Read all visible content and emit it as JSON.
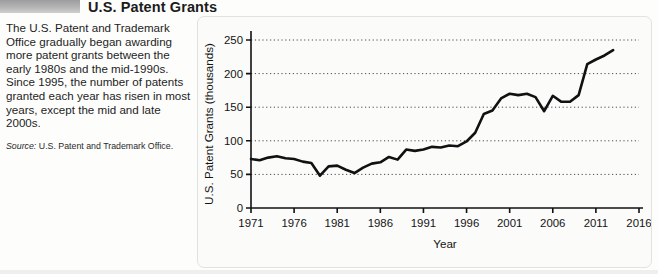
{
  "figure": {
    "title": "U.S. Patent Grants",
    "blurb": "The U.S. Patent and Trademark Office gradually began awarding more patent grants between the early 1980s and the mid-1990s. Since 1995, the number of patents granted each year has risen in most years, except the mid and late 2000s.",
    "source_lead": "Source:",
    "source_text": " U.S. Patent and Trademark Office."
  },
  "chart_data": {
    "type": "line",
    "title": "U.S. Patent Grants",
    "xlabel": "Year",
    "ylabel": "U.S. Patent Grants (thousands)",
    "xlim": [
      1971,
      2016
    ],
    "ylim": [
      0,
      250
    ],
    "xticks": [
      1971,
      1976,
      1981,
      1986,
      1991,
      1996,
      2001,
      2006,
      2011,
      2016
    ],
    "xtick_labels": [
      "1971",
      "1976",
      "1981",
      "1986",
      "1991",
      "1996",
      "2001",
      "2006",
      "2011",
      "2016"
    ],
    "yticks": [
      0,
      50,
      100,
      150,
      200,
      250
    ],
    "ytick_labels": [
      "0",
      "50",
      "100",
      "150",
      "200",
      "250"
    ],
    "grid": "horizontal-dotted",
    "legend": "none",
    "line_color": "#111111",
    "line_width": 2.6,
    "x": [
      1971,
      1972,
      1973,
      1974,
      1975,
      1976,
      1977,
      1978,
      1979,
      1980,
      1981,
      1982,
      1983,
      1984,
      1985,
      1986,
      1987,
      1988,
      1989,
      1990,
      1991,
      1992,
      1993,
      1994,
      1995,
      1996,
      1997,
      1998,
      1999,
      2000,
      2001,
      2002,
      2003,
      2004,
      2005,
      2006,
      2007,
      2008,
      2009,
      2010,
      2011,
      2012,
      2013
    ],
    "values": [
      73,
      71,
      75,
      77,
      74,
      73,
      69,
      67,
      48,
      62,
      63,
      57,
      52,
      60,
      66,
      68,
      76,
      72,
      87,
      85,
      87,
      91,
      90,
      93,
      92,
      99,
      112,
      140,
      145,
      163,
      170,
      168,
      170,
      165,
      144,
      167,
      158,
      158,
      168,
      214,
      221,
      227,
      235
    ],
    "annotations": []
  }
}
